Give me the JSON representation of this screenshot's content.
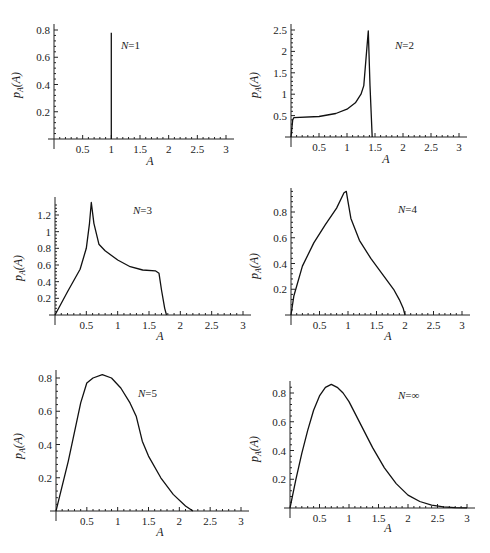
{
  "chart_data": [
    {
      "type": "line",
      "title": "N=1",
      "xlabel": "A",
      "ylabel": "p_A(A)",
      "xlim": [
        0,
        3
      ],
      "ylim": [
        0,
        0.8
      ],
      "xticks": [
        "0.5",
        "1",
        "1.5",
        "2",
        "2.5",
        "3"
      ],
      "yticks": [
        "0.2",
        "0.4",
        "0.6",
        "0.8"
      ],
      "grid": false,
      "series": [
        {
          "name": "N=1",
          "x": [
            1,
            1
          ],
          "y": [
            0,
            0.78
          ],
          "note": "delta spike at A=1"
        }
      ]
    },
    {
      "type": "line",
      "title": "N=2",
      "xlabel": "A",
      "ylabel": "p_A(A)",
      "xlim": [
        0,
        3
      ],
      "ylim": [
        0,
        2.5
      ],
      "xticks": [
        "0.5",
        "1",
        "1.5",
        "2",
        "2.5",
        "3"
      ],
      "yticks": [
        "0.5",
        "1",
        "1.5",
        "2",
        "2.5"
      ],
      "grid": false,
      "series": [
        {
          "name": "N=2",
          "x": [
            0,
            0.03,
            0.05,
            0.5,
            0.8,
            1.0,
            1.15,
            1.25,
            1.3,
            1.35,
            1.38,
            1.41,
            1.45
          ],
          "y": [
            0,
            0.4,
            0.45,
            0.48,
            0.55,
            0.65,
            0.8,
            1.0,
            1.2,
            2.0,
            2.48,
            1.2,
            0
          ]
        }
      ]
    },
    {
      "type": "line",
      "title": "N=3",
      "xlabel": "A",
      "ylabel": "p_A(A)",
      "xlim": [
        0,
        3
      ],
      "ylim": [
        0,
        1.35
      ],
      "xticks": [
        "0.5",
        "1",
        "1.5",
        "2",
        "2.5",
        "3"
      ],
      "yticks": [
        "0.2",
        "0.4",
        "0.6",
        "0.8",
        "1",
        "1.2"
      ],
      "grid": false,
      "series": [
        {
          "name": "N=3",
          "x": [
            0,
            0.2,
            0.4,
            0.5,
            0.55,
            0.58,
            0.62,
            0.7,
            0.8,
            1.0,
            1.2,
            1.4,
            1.6,
            1.66,
            1.7,
            1.75,
            1.78
          ],
          "y": [
            0,
            0.28,
            0.55,
            0.8,
            1.1,
            1.35,
            1.1,
            0.85,
            0.77,
            0.66,
            0.58,
            0.54,
            0.53,
            0.5,
            0.3,
            0.08,
            0
          ]
        }
      ]
    },
    {
      "type": "line",
      "title": "N=4",
      "xlabel": "A",
      "ylabel": "p_A(A)",
      "xlim": [
        0,
        3
      ],
      "ylim": [
        0,
        0.97
      ],
      "xticks": [
        "0.5",
        "1",
        "1.5",
        "2",
        "2.5",
        "3"
      ],
      "yticks": [
        "0.2",
        "0.4",
        "0.6",
        "0.8"
      ],
      "grid": false,
      "series": [
        {
          "name": "N=4",
          "x": [
            0,
            0.05,
            0.2,
            0.4,
            0.6,
            0.8,
            0.93,
            0.97,
            1.0,
            1.05,
            1.2,
            1.4,
            1.6,
            1.8,
            1.9,
            1.97,
            2.0
          ],
          "y": [
            0,
            0.15,
            0.38,
            0.56,
            0.7,
            0.83,
            0.95,
            0.96,
            0.88,
            0.75,
            0.58,
            0.44,
            0.32,
            0.2,
            0.12,
            0.05,
            0
          ]
        }
      ]
    },
    {
      "type": "line",
      "title": "N=5",
      "xlabel": "A",
      "ylabel": "p_A(A)",
      "xlim": [
        0,
        3
      ],
      "ylim": [
        0,
        0.82
      ],
      "xticks": [
        "0.5",
        "1",
        "1.5",
        "2",
        "2.5",
        "3"
      ],
      "yticks": [
        "0.2",
        "0.4",
        "0.6",
        "0.8"
      ],
      "grid": false,
      "series": [
        {
          "name": "N=5",
          "x": [
            0,
            0.2,
            0.4,
            0.5,
            0.6,
            0.75,
            0.9,
            1.05,
            1.2,
            1.3,
            1.4,
            1.5,
            1.7,
            1.9,
            2.1,
            2.22
          ],
          "y": [
            0,
            0.3,
            0.65,
            0.77,
            0.8,
            0.82,
            0.8,
            0.74,
            0.65,
            0.57,
            0.42,
            0.33,
            0.2,
            0.1,
            0.03,
            0
          ]
        }
      ]
    },
    {
      "type": "line",
      "title": "N=∞",
      "xlabel": "A",
      "ylabel": "p_A(A)",
      "xlim": [
        0,
        3
      ],
      "ylim": [
        0,
        0.86
      ],
      "xticks": [
        "0.5",
        "1",
        "1.5",
        "2",
        "2.5",
        "3"
      ],
      "yticks": [
        "0.2",
        "0.4",
        "0.6",
        "0.8"
      ],
      "grid": false,
      "series": [
        {
          "name": "N=∞",
          "x": [
            0,
            0.1,
            0.2,
            0.3,
            0.4,
            0.5,
            0.6,
            0.7,
            0.8,
            0.9,
            1.0,
            1.2,
            1.4,
            1.6,
            1.8,
            2.0,
            2.2,
            2.4,
            2.6,
            2.8,
            3.0
          ],
          "y": [
            0,
            0.2,
            0.38,
            0.54,
            0.68,
            0.78,
            0.84,
            0.86,
            0.84,
            0.8,
            0.74,
            0.58,
            0.42,
            0.28,
            0.17,
            0.09,
            0.045,
            0.02,
            0.008,
            0.003,
            0.001
          ]
        }
      ]
    }
  ],
  "panels": [
    {
      "n_label": "N=1",
      "xlabel": "A",
      "ylabel_main": "p",
      "ylabel_sub": "A",
      "ylabel_arg": "(A)"
    },
    {
      "n_label": "N=2",
      "xlabel": "A",
      "ylabel_main": "p",
      "ylabel_sub": "A",
      "ylabel_arg": "(A)"
    },
    {
      "n_label": "N=3",
      "xlabel": "A",
      "ylabel_main": "p",
      "ylabel_sub": "A",
      "ylabel_arg": "(A)"
    },
    {
      "n_label": "N=4",
      "xlabel": "A",
      "ylabel_main": "p",
      "ylabel_sub": "A",
      "ylabel_arg": "(A)"
    },
    {
      "n_label": "N=5",
      "xlabel": "A",
      "ylabel_main": "p",
      "ylabel_sub": "A",
      "ylabel_arg": "(A)"
    },
    {
      "n_label": "N=∞",
      "xlabel": "A",
      "ylabel_main": "p",
      "ylabel_sub": "A",
      "ylabel_arg": "(A)"
    }
  ]
}
